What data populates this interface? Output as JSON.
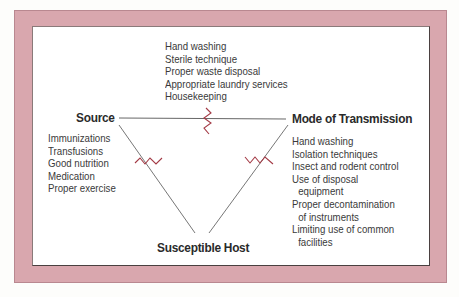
{
  "diagram": {
    "colors": {
      "frame": "#d9a7ae",
      "panel": "#ffffff",
      "line": "#555555",
      "break_mark": "#a33a45",
      "text": "#3a3a3a"
    },
    "nodes": {
      "source": {
        "label": "Source"
      },
      "mode_of_transmission": {
        "label": "Mode of Transmission"
      },
      "susceptible_host": {
        "label": "Susceptible Host"
      }
    },
    "edge_interventions": {
      "source_to_transmission": [
        "Hand washing",
        "Sterile technique",
        "Proper waste disposal",
        "Appropriate laundry services",
        "Housekeeping"
      ]
    },
    "source_interventions": [
      "Immunizations",
      "Transfusions",
      "Good nutrition",
      "Medication",
      "Proper exercise"
    ],
    "transmission_interventions": [
      {
        "line1": "Hand washing"
      },
      {
        "line1": "Isolation techniques"
      },
      {
        "line1": "Insect and rodent control"
      },
      {
        "line1": "Use of disposal",
        "line2": "equipment"
      },
      {
        "line1": "Proper decontamination",
        "line2": "of instruments"
      },
      {
        "line1": "Limiting use of common",
        "line2": "facilities"
      }
    ],
    "break_marks": [
      "zigzag-top-edge",
      "zigzag-left-edge",
      "zigzag-right-edge"
    ]
  }
}
